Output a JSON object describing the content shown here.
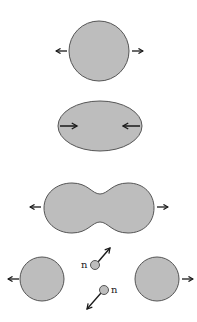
{
  "diagram": {
    "colors": {
      "fill": "#bdbdbd",
      "stroke": "#555555",
      "arrow": "#1a1a1a",
      "background": "#ffffff"
    },
    "stages": [
      {
        "id": "nucleus",
        "shape": "circle",
        "arrows": "outward"
      },
      {
        "id": "elongated",
        "shape": "ellipse",
        "arrows": "inward"
      },
      {
        "id": "dumbbell",
        "shape": "peanut",
        "arrows": "outward"
      },
      {
        "id": "fragments",
        "shape": "two-circles-with-neutrons",
        "arrows": "outward"
      }
    ],
    "neutrons": [
      {
        "label": "n",
        "direction": "up-right"
      },
      {
        "label": "n",
        "direction": "down-left"
      }
    ]
  }
}
